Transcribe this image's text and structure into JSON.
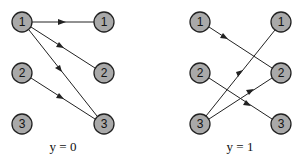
{
  "panels": [
    {
      "caption": "y = 0",
      "left_nodes": [
        "1",
        "2",
        "3"
      ],
      "right_nodes": [
        "1",
        "2",
        "3"
      ],
      "edges": [
        [
          "L1",
          "R1"
        ],
        [
          "L1",
          "R2"
        ],
        [
          "L1",
          "R3"
        ],
        [
          "L2",
          "R3"
        ]
      ]
    },
    {
      "caption": "y = 1",
      "left_nodes": [
        "1",
        "2",
        "3"
      ],
      "right_nodes": [
        "1",
        "2",
        "3"
      ],
      "edges": [
        [
          "L1",
          "R2"
        ],
        [
          "L2",
          "R3"
        ],
        [
          "L3",
          "R1"
        ],
        [
          "L3",
          "R2"
        ]
      ]
    }
  ],
  "colors": {
    "node_fill": "#a9a9a9",
    "stroke": "#222222"
  }
}
